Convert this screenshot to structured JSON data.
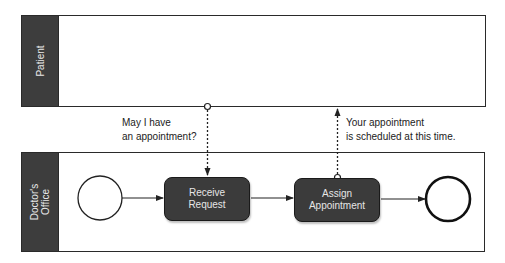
{
  "pools": [
    {
      "id": "patient",
      "label": "Patient"
    },
    {
      "id": "doctors_office",
      "label": "Doctor's\nOffice"
    }
  ],
  "tasks": [
    {
      "id": "receive_request",
      "label": "Receive\nRequest"
    },
    {
      "id": "assign_appointment",
      "label": "Assign\nAppointment"
    }
  ],
  "events": [
    {
      "id": "start",
      "type": "start-event"
    },
    {
      "id": "end",
      "type": "end-event"
    }
  ],
  "message_flows": [
    {
      "from": "patient",
      "to": "receive_request",
      "label": "May I have\nan appointment?"
    },
    {
      "from": "assign_appointment",
      "to": "patient",
      "label": "Your appointment\nis scheduled at this time."
    }
  ],
  "sequence_flows": [
    {
      "from": "start",
      "to": "receive_request"
    },
    {
      "from": "receive_request",
      "to": "assign_appointment"
    },
    {
      "from": "assign_appointment",
      "to": "end"
    }
  ],
  "colors": {
    "header": "#3d3d3d",
    "task": "#3b3b3b",
    "line": "#222222"
  }
}
